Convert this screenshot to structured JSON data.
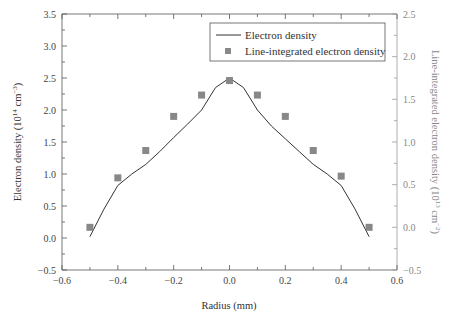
{
  "chart_data": {
    "type": "line",
    "title": "",
    "xlabel": "Radius (mm)",
    "ylabel": "Electron density (10^14 cm^-3)",
    "ylabel_right": "Line-integrated electron density (10^13 cm^-2)",
    "xlim": [
      -0.6,
      0.6
    ],
    "ylim": [
      -0.5,
      3.5
    ],
    "ylim_right": [
      -0.5,
      2.5
    ],
    "grid": false,
    "legend_position": "upper right",
    "x_ticks": [
      "-0.6",
      "-0.4",
      "-0.2",
      "0.0",
      "0.2",
      "0.4",
      "0.6"
    ],
    "y_ticks": [
      "-0.5",
      "0.0",
      "0.5",
      "1.0",
      "1.5",
      "2.0",
      "2.5",
      "3.0",
      "3.5"
    ],
    "y_ticks_right": [
      "-0.5",
      "0.0",
      "0.5",
      "1.0",
      "1.5",
      "2.0",
      "2.5"
    ],
    "series": [
      {
        "name": "Electron density",
        "style": "line",
        "axis": "left",
        "color": "#333333",
        "x": [
          -0.5,
          -0.45,
          -0.4,
          -0.35,
          -0.3,
          -0.25,
          -0.2,
          -0.15,
          -0.1,
          -0.05,
          0.0,
          0.05,
          0.1,
          0.15,
          0.2,
          0.25,
          0.3,
          0.35,
          0.4,
          0.45,
          0.5
        ],
        "values": [
          0.02,
          0.45,
          0.82,
          1.0,
          1.15,
          1.35,
          1.57,
          1.78,
          2.0,
          2.35,
          2.5,
          2.35,
          2.0,
          1.75,
          1.55,
          1.35,
          1.15,
          1.0,
          0.82,
          0.45,
          0.02
        ]
      },
      {
        "name": "Line-integrated electron density",
        "style": "square-marker",
        "axis": "right",
        "color": "#888888",
        "x": [
          -0.5,
          -0.4,
          -0.3,
          -0.2,
          -0.1,
          0.0,
          0.1,
          0.2,
          0.3,
          0.4,
          0.5
        ],
        "values": [
          0.0,
          0.58,
          0.9,
          1.3,
          1.55,
          1.72,
          1.55,
          1.3,
          0.9,
          0.6,
          0.0
        ]
      }
    ]
  },
  "legend": {
    "line_label": "Electron density",
    "marker_label": "Line-integrated electron density"
  }
}
